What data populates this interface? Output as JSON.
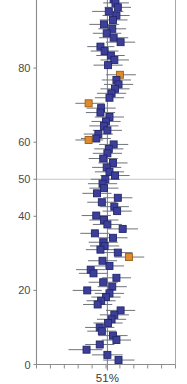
{
  "chart_data": {
    "type": "scatter",
    "title": "",
    "subtitle": "",
    "xlabel": "51%",
    "ylabel": "",
    "grid": true,
    "legend_position": "none",
    "x_axis": {
      "visible_tick_labels": [],
      "reference_line_label": "51%",
      "reference_line_x": 51,
      "xlim": [
        0,
        100
      ],
      "tick_count": 11
    },
    "y_axis": {
      "tick_labels": [
        "0",
        "20",
        "40",
        "50",
        "60",
        "80",
        "100"
      ],
      "tick_values": [
        0,
        20,
        40,
        50,
        60,
        80,
        100
      ],
      "ylim": [
        0,
        100
      ],
      "gridline_at": 50,
      "top_label_clipped": true
    },
    "colors": {
      "marker_primary": "#3c3f99",
      "marker_primary_edge": "#23256b",
      "marker_highlight": "#dd8b2c",
      "marker_highlight_edge": "#9c5d12",
      "error_bar": "#6e747c",
      "reference_line": "#5b6aa8",
      "gridline": "#b9b9b9",
      "axis": "#8c8c8c",
      "frame": "#a8a8a8",
      "text": "#4a4a4a",
      "background": "#ffffff"
    },
    "series": [
      {
        "name": "Estimates",
        "marker": "square",
        "points": [
          {
            "y": 99.6,
            "x": 51.4,
            "lo": 41.0,
            "hi": 61.0,
            "hl": false
          },
          {
            "y": 98.6,
            "x": 55.5,
            "lo": 46.5,
            "hi": 65.0,
            "hl": false
          },
          {
            "y": 97.6,
            "x": 56.8,
            "lo": 48.0,
            "hi": 66.5,
            "hl": false
          },
          {
            "y": 96.4,
            "x": 58.5,
            "lo": 49.0,
            "hi": 68.0,
            "hl": false
          },
          {
            "y": 95.3,
            "x": 52.0,
            "lo": 40.0,
            "hi": 62.5,
            "hl": false
          },
          {
            "y": 94.2,
            "x": 57.5,
            "lo": 47.5,
            "hi": 67.0,
            "hl": false
          },
          {
            "y": 93.0,
            "x": 55.0,
            "lo": 45.5,
            "hi": 65.5,
            "hl": false
          },
          {
            "y": 91.8,
            "x": 48.5,
            "lo": 38.0,
            "hi": 59.5,
            "hl": false
          },
          {
            "y": 90.6,
            "x": 54.5,
            "lo": 44.5,
            "hi": 64.5,
            "hl": false
          },
          {
            "y": 89.4,
            "x": 50.5,
            "lo": 40.5,
            "hi": 61.0,
            "hl": false
          },
          {
            "y": 88.2,
            "x": 55.5,
            "lo": 45.0,
            "hi": 66.0,
            "hl": false
          },
          {
            "y": 87.0,
            "x": 60.5,
            "lo": 50.0,
            "hi": 71.0,
            "hl": false
          },
          {
            "y": 85.8,
            "x": 46.0,
            "lo": 36.5,
            "hi": 56.0,
            "hl": false
          },
          {
            "y": 84.6,
            "x": 49.0,
            "lo": 39.0,
            "hi": 59.0,
            "hl": false
          },
          {
            "y": 83.4,
            "x": 53.5,
            "lo": 43.0,
            "hi": 63.5,
            "hl": false
          },
          {
            "y": 82.2,
            "x": 56.0,
            "lo": 46.0,
            "hi": 66.5,
            "hl": false
          },
          {
            "y": 80.8,
            "x": 51.5,
            "lo": 41.0,
            "hi": 62.0,
            "hl": false
          },
          {
            "y": 78.2,
            "x": 60.0,
            "lo": 50.0,
            "hi": 71.5,
            "hl": true
          },
          {
            "y": 76.8,
            "x": 57.5,
            "lo": 47.0,
            "hi": 68.0,
            "hl": false
          },
          {
            "y": 75.6,
            "x": 59.0,
            "lo": 48.5,
            "hi": 69.5,
            "hl": false
          },
          {
            "y": 74.4,
            "x": 56.5,
            "lo": 46.0,
            "hi": 67.0,
            "hl": false
          },
          {
            "y": 73.2,
            "x": 54.0,
            "lo": 43.5,
            "hi": 64.5,
            "hl": false
          },
          {
            "y": 72.0,
            "x": 52.5,
            "lo": 42.0,
            "hi": 63.0,
            "hl": false
          },
          {
            "y": 70.5,
            "x": 37.5,
            "lo": 28.0,
            "hi": 49.0,
            "hl": true
          },
          {
            "y": 69.2,
            "x": 46.5,
            "lo": 36.0,
            "hi": 57.0,
            "hl": false
          },
          {
            "y": 68.0,
            "x": 46.0,
            "lo": 35.5,
            "hi": 56.5,
            "hl": false
          },
          {
            "y": 66.8,
            "x": 52.5,
            "lo": 42.0,
            "hi": 63.0,
            "hl": false
          },
          {
            "y": 65.6,
            "x": 50.0,
            "lo": 39.5,
            "hi": 60.5,
            "hl": false
          },
          {
            "y": 64.4,
            "x": 48.5,
            "lo": 38.0,
            "hi": 59.0,
            "hl": false
          },
          {
            "y": 63.2,
            "x": 51.0,
            "lo": 40.5,
            "hi": 61.5,
            "hl": false
          },
          {
            "y": 62.2,
            "x": 44.5,
            "lo": 34.0,
            "hi": 55.0,
            "hl": false
          },
          {
            "y": 61.0,
            "x": 43.0,
            "lo": 32.0,
            "hi": 53.5,
            "hl": false
          },
          {
            "y": 60.6,
            "x": 37.5,
            "lo": 28.0,
            "hi": 48.0,
            "hl": true
          },
          {
            "y": 59.4,
            "x": 55.5,
            "lo": 45.0,
            "hi": 66.0,
            "hl": false
          },
          {
            "y": 58.2,
            "x": 52.0,
            "lo": 41.5,
            "hi": 62.5,
            "hl": false
          },
          {
            "y": 57.0,
            "x": 51.0,
            "lo": 40.5,
            "hi": 61.5,
            "hl": false
          },
          {
            "y": 55.6,
            "x": 48.0,
            "lo": 37.5,
            "hi": 58.5,
            "hl": false
          },
          {
            "y": 54.4,
            "x": 55.0,
            "lo": 44.5,
            "hi": 65.5,
            "hl": false
          },
          {
            "y": 53.2,
            "x": 50.5,
            "lo": 40.0,
            "hi": 61.0,
            "hl": false
          },
          {
            "y": 52.0,
            "x": 52.5,
            "lo": 42.0,
            "hi": 63.0,
            "hl": false
          },
          {
            "y": 51.0,
            "x": 56.5,
            "lo": 46.0,
            "hi": 67.0,
            "hl": false
          },
          {
            "y": 50.0,
            "x": 49.5,
            "lo": 39.0,
            "hi": 60.0,
            "hl": false
          },
          {
            "y": 48.8,
            "x": 47.5,
            "lo": 37.0,
            "hi": 58.0,
            "hl": false
          },
          {
            "y": 47.6,
            "x": 48.5,
            "lo": 38.0,
            "hi": 59.0,
            "hl": false
          },
          {
            "y": 46.2,
            "x": 43.5,
            "lo": 33.0,
            "hi": 54.0,
            "hl": false
          },
          {
            "y": 45.0,
            "x": 58.5,
            "lo": 48.0,
            "hi": 69.0,
            "hl": false
          },
          {
            "y": 43.8,
            "x": 47.0,
            "lo": 36.5,
            "hi": 57.5,
            "hl": false
          },
          {
            "y": 42.6,
            "x": 56.0,
            "lo": 45.5,
            "hi": 66.5,
            "hl": false
          },
          {
            "y": 41.4,
            "x": 58.0,
            "lo": 47.5,
            "hi": 68.5,
            "hl": false
          },
          {
            "y": 40.2,
            "x": 43.0,
            "lo": 32.5,
            "hi": 53.5,
            "hl": false
          },
          {
            "y": 39.0,
            "x": 48.5,
            "lo": 38.0,
            "hi": 59.0,
            "hl": false
          },
          {
            "y": 37.8,
            "x": 51.0,
            "lo": 40.5,
            "hi": 61.5,
            "hl": false
          },
          {
            "y": 36.6,
            "x": 62.0,
            "lo": 51.5,
            "hi": 73.0,
            "hl": false
          },
          {
            "y": 35.4,
            "x": 42.0,
            "lo": 31.5,
            "hi": 52.5,
            "hl": false
          },
          {
            "y": 34.2,
            "x": 55.0,
            "lo": 44.5,
            "hi": 65.5,
            "hl": false
          },
          {
            "y": 33.0,
            "x": 48.0,
            "lo": 37.5,
            "hi": 58.5,
            "hl": false
          },
          {
            "y": 32.0,
            "x": 49.0,
            "lo": 38.5,
            "hi": 59.5,
            "hl": false
          },
          {
            "y": 31.0,
            "x": 46.0,
            "lo": 35.5,
            "hi": 56.5,
            "hl": false
          },
          {
            "y": 30.2,
            "x": 58.5,
            "lo": 48.0,
            "hi": 69.0,
            "hl": false
          },
          {
            "y": 29.0,
            "x": 66.5,
            "lo": 56.0,
            "hi": 77.5,
            "hl": true
          },
          {
            "y": 28.0,
            "x": 47.5,
            "lo": 37.0,
            "hi": 58.0,
            "hl": false
          },
          {
            "y": 26.6,
            "x": 52.5,
            "lo": 42.0,
            "hi": 63.0,
            "hl": false
          },
          {
            "y": 25.6,
            "x": 39.0,
            "lo": 28.5,
            "hi": 49.5,
            "hl": false
          },
          {
            "y": 24.6,
            "x": 41.0,
            "lo": 30.5,
            "hi": 51.5,
            "hl": false
          },
          {
            "y": 23.4,
            "x": 57.5,
            "lo": 47.0,
            "hi": 68.0,
            "hl": false
          },
          {
            "y": 22.2,
            "x": 48.0,
            "lo": 37.5,
            "hi": 58.5,
            "hl": false
          },
          {
            "y": 21.0,
            "x": 54.5,
            "lo": 44.0,
            "hi": 65.0,
            "hl": false
          },
          {
            "y": 20.0,
            "x": 36.5,
            "lo": 26.0,
            "hi": 47.0,
            "hl": false
          },
          {
            "y": 19.2,
            "x": 52.5,
            "lo": 42.0,
            "hi": 63.0,
            "hl": false
          },
          {
            "y": 18.2,
            "x": 50.0,
            "lo": 39.5,
            "hi": 60.5,
            "hl": false
          },
          {
            "y": 17.2,
            "x": 46.5,
            "lo": 36.0,
            "hi": 57.0,
            "hl": false
          },
          {
            "y": 16.2,
            "x": 44.0,
            "lo": 33.5,
            "hi": 54.5,
            "hl": false
          },
          {
            "y": 14.6,
            "x": 60.5,
            "lo": 50.0,
            "hi": 71.0,
            "hl": false
          },
          {
            "y": 13.4,
            "x": 56.0,
            "lo": 45.5,
            "hi": 66.5,
            "hl": false
          },
          {
            "y": 12.2,
            "x": 54.0,
            "lo": 43.5,
            "hi": 64.5,
            "hl": false
          },
          {
            "y": 11.2,
            "x": 51.5,
            "lo": 41.0,
            "hi": 62.0,
            "hl": false
          },
          {
            "y": 10.0,
            "x": 45.5,
            "lo": 35.0,
            "hi": 56.0,
            "hl": false
          },
          {
            "y": 9.0,
            "x": 47.0,
            "lo": 36.5,
            "hi": 57.5,
            "hl": false
          },
          {
            "y": 7.8,
            "x": 55.0,
            "lo": 44.5,
            "hi": 65.5,
            "hl": false
          },
          {
            "y": 6.6,
            "x": 57.5,
            "lo": 47.0,
            "hi": 68.0,
            "hl": false
          },
          {
            "y": 5.4,
            "x": 45.5,
            "lo": 35.0,
            "hi": 56.0,
            "hl": false
          },
          {
            "y": 4.0,
            "x": 36.0,
            "lo": 23.0,
            "hi": 47.5,
            "hl": false
          },
          {
            "y": 2.6,
            "x": 51.0,
            "lo": 40.0,
            "hi": 62.0,
            "hl": false
          },
          {
            "y": 1.2,
            "x": 59.0,
            "lo": 48.0,
            "hi": 70.5,
            "hl": false
          }
        ]
      }
    ]
  }
}
